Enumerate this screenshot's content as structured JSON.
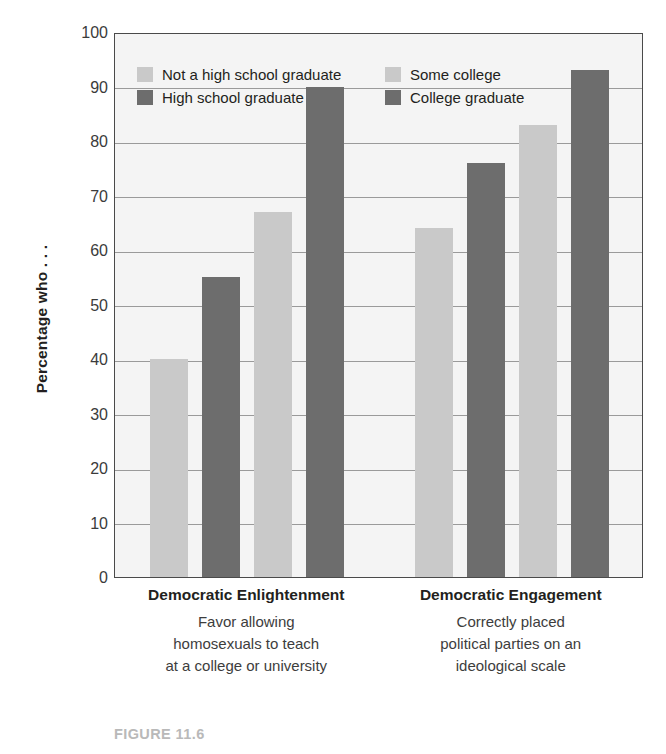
{
  "figure": {
    "caption": "FIGURE 11.6"
  },
  "chart_data": {
    "type": "bar",
    "title": "",
    "xlabel": "",
    "ylabel": "Percentage who . . .",
    "ylim": [
      0,
      100
    ],
    "ytick_step": 10,
    "ytick_labels": [
      "0",
      "10",
      "20",
      "30",
      "40",
      "50",
      "60",
      "70",
      "80",
      "90",
      "100"
    ],
    "ytick_values": [
      0,
      10,
      20,
      30,
      40,
      50,
      60,
      70,
      80,
      90,
      100
    ],
    "grid": true,
    "grid_axis": "y",
    "legend_position": "inside-top-left",
    "categories": [
      "Democratic Enlightenment",
      "Democratic Engagement"
    ],
    "series": [
      {
        "name": "Not a high school graduate",
        "color": "#c9c9c9",
        "values": [
          40,
          64
        ]
      },
      {
        "name": "High school graduate",
        "color": "#6d6d6d",
        "values": [
          55,
          76
        ]
      },
      {
        "name": "Some college",
        "color": "#c9c9c9",
        "values": [
          67,
          83
        ]
      },
      {
        "name": "College graduate",
        "color": "#6d6d6d",
        "values": [
          90,
          93
        ]
      }
    ],
    "plot_background": "#f4f4f4",
    "axis_color": "#4a4a4a",
    "gridline_color": "#9a9a9a"
  },
  "legend": {
    "entries": [
      {
        "label": "Not a high school graduate",
        "color": "#c9c9c9"
      },
      {
        "label": "Some college",
        "color": "#c9c9c9"
      },
      {
        "label": "High school graduate",
        "color": "#6d6d6d"
      },
      {
        "label": "College graduate",
        "color": "#6d6d6d"
      }
    ]
  },
  "groups": [
    {
      "title": "Democratic Enlightenment",
      "description_lines": [
        "Favor allowing",
        "homosexuals to teach",
        "at a college or university"
      ]
    },
    {
      "title": "Democratic Engagement",
      "description_lines": [
        "Correctly placed",
        "political parties on an",
        "ideological scale"
      ]
    }
  ]
}
